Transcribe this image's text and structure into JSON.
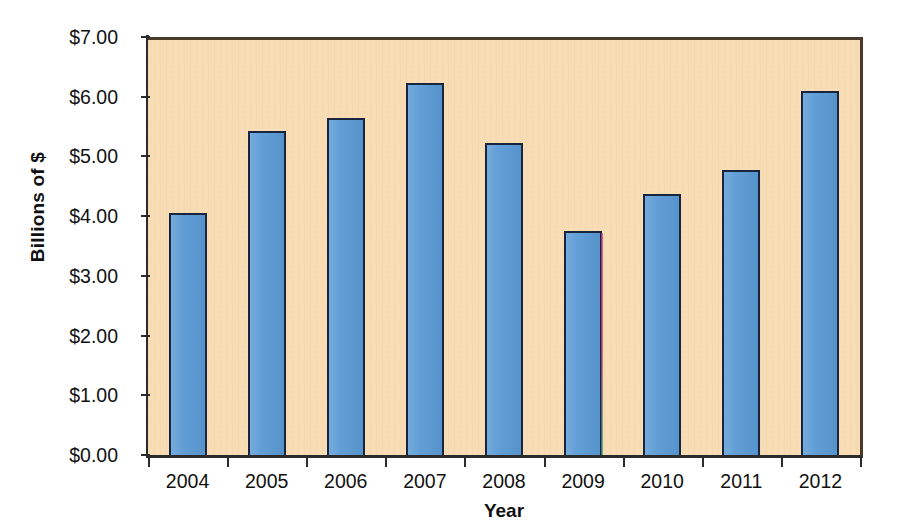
{
  "chart_data": {
    "type": "bar",
    "title": "",
    "xlabel": "Year",
    "ylabel": "Billions of $",
    "categories": [
      "2004",
      "2005",
      "2006",
      "2007",
      "2008",
      "2009",
      "2010",
      "2011",
      "2012"
    ],
    "values": [
      4.1,
      5.48,
      5.7,
      6.28,
      5.27,
      3.81,
      4.42,
      4.82,
      6.15
    ],
    "ylim": [
      0,
      7
    ],
    "ytick_values": [
      0,
      1,
      2,
      3,
      4,
      5,
      6,
      7
    ],
    "ytick_labels": [
      "$0.00",
      "$1.00",
      "$2.00",
      "$3.00",
      "$4.00",
      "$5.00",
      "$6.00",
      "$7.00"
    ],
    "grid": false,
    "legend": false,
    "series": [
      {
        "name": "Billions of $",
        "values": [
          4.1,
          5.48,
          5.7,
          6.28,
          5.27,
          3.81,
          4.42,
          4.82,
          6.15
        ]
      }
    ]
  },
  "style": {
    "bar_fill": "#5B9BD5",
    "bar_border": "#19243F",
    "plot_background": "#F8DCB4",
    "page_background": "#FFFFFF",
    "axis_color": "#2B2B2B",
    "text_color": "#111111"
  }
}
